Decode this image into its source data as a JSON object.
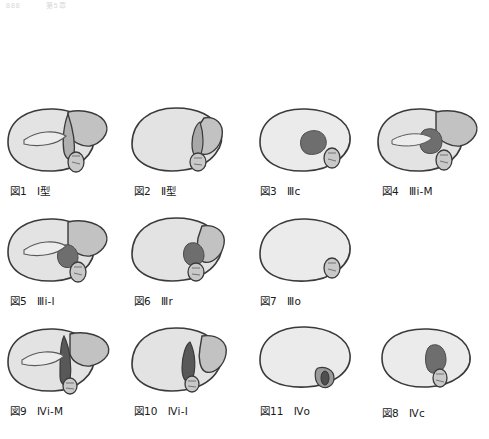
{
  "header": {
    "page_number": "888",
    "running_title": "第5章"
  },
  "palette": {
    "organ_fill": "#e3e3e3",
    "organ_fill_light": "#ebebeb",
    "organ_outline": "#3a3a3a",
    "mid_gray": "#b8b8b8",
    "duct_gray": "#c9c9c9",
    "lesion_dark": "#6e6e6e",
    "lesion_darker": "#585858",
    "caption_color": "#1a1a1a"
  },
  "figures": [
    {
      "id": "fig-1",
      "number": "図1",
      "type_label": "Ⅰ型",
      "column": 1,
      "row": 1,
      "has_lesion": false,
      "variant": "liver-with-duct"
    },
    {
      "id": "fig-2",
      "number": "図2",
      "type_label": "Ⅱ型",
      "column": 2,
      "row": 1,
      "has_lesion": false,
      "variant": "liver-notch"
    },
    {
      "id": "fig-3",
      "number": "図3",
      "type_label": "Ⅲc",
      "column": 3,
      "row": 1,
      "has_lesion": true,
      "variant": "liver-central-lesion"
    },
    {
      "id": "fig-4",
      "number": "図4",
      "type_label": "Ⅲi-M",
      "column": 4,
      "row": 1,
      "has_lesion": true,
      "variant": "liver-lesion-duct"
    },
    {
      "id": "fig-5",
      "number": "図5",
      "type_label": "Ⅲi-I",
      "column": 1,
      "row": 2,
      "has_lesion": true,
      "variant": "liver-lesion-duct"
    },
    {
      "id": "fig-6",
      "number": "図6",
      "type_label": "Ⅲr",
      "column": 2,
      "row": 2,
      "has_lesion": true,
      "variant": "liver-notch-lesion"
    },
    {
      "id": "fig-7",
      "number": "図7",
      "type_label": "Ⅲo",
      "column": 3,
      "row": 2,
      "has_lesion": false,
      "variant": "liver-plain"
    },
    {
      "id": "fig-8",
      "number": "図8",
      "type_label": "Ⅳc",
      "column": 4,
      "row": 3,
      "has_lesion": true,
      "variant": "liver-central-lesion"
    },
    {
      "id": "fig-9",
      "number": "図9",
      "type_label": "Ⅳi-M",
      "column": 1,
      "row": 3,
      "has_lesion": true,
      "variant": "liver-dark-duct"
    },
    {
      "id": "fig-10",
      "number": "図10",
      "type_label": "Ⅳi-I",
      "column": 2,
      "row": 3,
      "has_lesion": true,
      "variant": "liver-dark-duct"
    },
    {
      "id": "fig-11",
      "number": "図11",
      "type_label": "Ⅳo",
      "column": 3,
      "row": 3,
      "has_lesion": true,
      "variant": "liver-plain-spot"
    }
  ]
}
